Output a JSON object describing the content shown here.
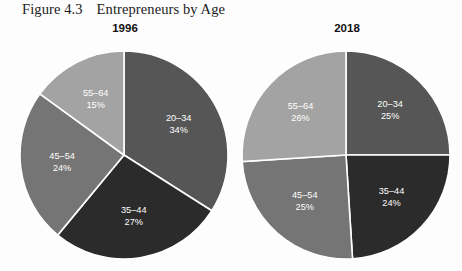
{
  "figure": {
    "number": "Figure 4.3",
    "title": "Entrepreneurs by Age"
  },
  "chart_data": {
    "type": "pie",
    "title": "Entrepreneurs by Age",
    "figure_number": "Figure 4.3",
    "categories": [
      "20–34",
      "35–44",
      "45–54",
      "55–64"
    ],
    "colors": {
      "20–34": "#565656",
      "35–44": "#2b2b2b",
      "45–54": "#757575",
      "55–64": "#a3a3a3"
    },
    "slice_separator_color": "#ffffff",
    "start_angle_deg": 0,
    "direction": "clockwise",
    "legend": "none",
    "grid": false,
    "charts": [
      {
        "name": "1996",
        "label": "1996",
        "values": [
          34,
          27,
          24,
          15
        ],
        "slices": [
          {
            "category": "20–34",
            "label": "20–34",
            "value": 34,
            "value_label": "34%",
            "color": "#565656"
          },
          {
            "category": "35–44",
            "label": "35–44",
            "value": 27,
            "value_label": "27%",
            "color": "#2b2b2b"
          },
          {
            "category": "45–54",
            "label": "45–54",
            "value": 24,
            "value_label": "24%",
            "color": "#757575"
          },
          {
            "category": "55–64",
            "label": "55–64",
            "value": 15,
            "value_label": "15%",
            "color": "#a3a3a3"
          }
        ]
      },
      {
        "name": "2018",
        "label": "2018",
        "values": [
          25,
          24,
          25,
          26
        ],
        "slices": [
          {
            "category": "20–34",
            "label": "20–34",
            "value": 25,
            "value_label": "25%",
            "color": "#565656"
          },
          {
            "category": "35–44",
            "label": "35–44",
            "value": 24,
            "value_label": "24%",
            "color": "#2b2b2b"
          },
          {
            "category": "45–54",
            "label": "45–54",
            "value": 25,
            "value_label": "25%",
            "color": "#757575"
          },
          {
            "category": "55–64",
            "label": "55–64",
            "value": 26,
            "value_label": "26%",
            "color": "#a3a3a3"
          }
        ]
      }
    ]
  }
}
